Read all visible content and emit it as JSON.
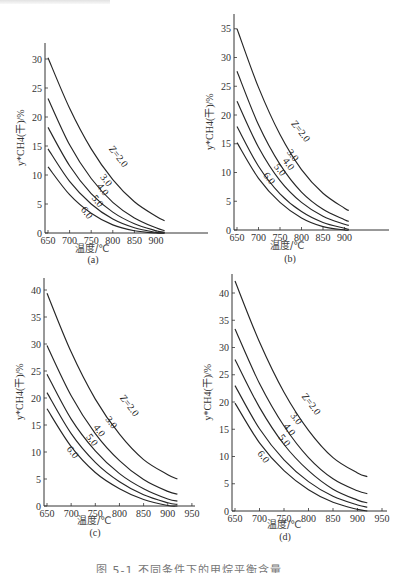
{
  "figure": {
    "caption": "图 5-1  不同条件下的甲烷平衡含量",
    "x_axis_label": "温度/℃",
    "y_axis_label": "y*CH4(干)/%"
  },
  "chart_data": [
    {
      "panel": "(a)",
      "type": "line",
      "xlabel": "温度/℃",
      "ylabel": "y*CH4(干)/%",
      "xlim": [
        650,
        920
      ],
      "ylim": [
        0,
        32
      ],
      "xticks": [
        650,
        700,
        750,
        800,
        850,
        900
      ],
      "yticks": [
        0,
        5,
        10,
        15,
        20,
        25,
        30
      ],
      "grid": false,
      "legend": "inline curve labels",
      "x": [
        650,
        700,
        750,
        800,
        850,
        900,
        920
      ],
      "series": [
        {
          "name": "Z=2.0",
          "values": [
            30.2,
            21.5,
            14.5,
            9.2,
            5.4,
            2.9,
            2.1
          ],
          "label_at": [
            790,
            14.5
          ],
          "label": "Z=2.0"
        },
        {
          "name": "3.0",
          "values": [
            23.2,
            15.2,
            9.4,
            5.3,
            2.6,
            0.9,
            0.4
          ],
          "label_at": [
            770,
            9.6
          ],
          "label": "3.0"
        },
        {
          "name": "4.0",
          "values": [
            18.2,
            11.6,
            6.8,
            3.6,
            1.6,
            0.4,
            0.1
          ],
          "label_at": [
            762,
            8.0
          ],
          "label": "4.0"
        },
        {
          "name": "5.0",
          "values": [
            14.5,
            8.9,
            5.0,
            2.4,
            0.9,
            0.1,
            0.0
          ],
          "label_at": [
            750,
            6.0
          ],
          "label": "5.0"
        },
        {
          "name": "6.0",
          "values": [
            11.4,
            6.6,
            3.4,
            1.4,
            0.4,
            0.0,
            0.0
          ],
          "label_at": [
            725,
            4.0
          ],
          "label": "6.0"
        }
      ]
    },
    {
      "panel": "(b)",
      "type": "line",
      "xlabel": "温度/℃",
      "ylabel": "y*CH4(干)/%",
      "xlim": [
        650,
        915
      ],
      "ylim": [
        0,
        37
      ],
      "xticks": [
        650,
        700,
        750,
        800,
        850,
        900
      ],
      "yticks": [
        0,
        5,
        10,
        15,
        20,
        25,
        30,
        35
      ],
      "grid": false,
      "legend": "inline curve labels",
      "x": [
        650,
        700,
        750,
        800,
        850,
        900,
        910
      ],
      "series": [
        {
          "name": "Z=2.0",
          "values": [
            35.0,
            24.8,
            16.6,
            10.5,
            6.4,
            3.8,
            3.4
          ],
          "label_at": [
            775,
            18.5
          ],
          "label": "Z=2.0"
        },
        {
          "name": "3.0",
          "values": [
            27.6,
            18.3,
            11.4,
            6.6,
            3.6,
            1.8,
            1.5
          ],
          "label_at": [
            765,
            13.5
          ],
          "label": "3.0"
        },
        {
          "name": "4.0",
          "values": [
            22.4,
            14.4,
            8.6,
            4.8,
            2.4,
            1.0,
            0.8
          ],
          "label_at": [
            755,
            12.0
          ],
          "label": "4.0"
        },
        {
          "name": "5.0",
          "values": [
            18.0,
            11.1,
            6.3,
            3.2,
            1.3,
            0.3,
            0.1
          ],
          "label_at": [
            735,
            11.0
          ],
          "label": "5.0"
        },
        {
          "name": "6.0",
          "values": [
            15.2,
            9.0,
            4.8,
            2.1,
            0.6,
            0.0,
            0.0
          ],
          "label_at": [
            710,
            9.5
          ],
          "label": "6.0"
        }
      ]
    },
    {
      "panel": "(c)",
      "type": "line",
      "xlabel": "温度/℃",
      "ylabel": "y*CH4(干)/%",
      "xlim": [
        650,
        950
      ],
      "ylim": [
        0,
        42
      ],
      "xticks": [
        650,
        700,
        750,
        800,
        850,
        900,
        950
      ],
      "yticks": [
        0,
        5,
        10,
        15,
        20,
        25,
        30,
        35,
        40
      ],
      "grid": false,
      "legend": "inline curve labels",
      "x": [
        650,
        700,
        750,
        800,
        850,
        900,
        920
      ],
      "series": [
        {
          "name": "Z=2.0",
          "values": [
            39.4,
            28.5,
            19.8,
            13.3,
            8.6,
            5.8,
            5.0
          ],
          "label_at": [
            800,
            20.0
          ],
          "label": "Z=2.0"
        },
        {
          "name": "3.0",
          "values": [
            29.7,
            20.4,
            13.4,
            8.4,
            4.9,
            2.7,
            2.2
          ],
          "label_at": [
            770,
            16.0
          ],
          "label": "3.0"
        },
        {
          "name": "4.0",
          "values": [
            24.4,
            16.1,
            10.2,
            6.0,
            3.2,
            1.3,
            0.9
          ],
          "label_at": [
            745,
            14.5
          ],
          "label": "4.0"
        },
        {
          "name": "5.0",
          "values": [
            21.0,
            13.4,
            8.1,
            4.5,
            2.1,
            0.6,
            0.3
          ],
          "label_at": [
            730,
            12.8
          ],
          "label": "5.0"
        },
        {
          "name": "6.0",
          "values": [
            18.0,
            11.0,
            6.2,
            3.2,
            1.2,
            0.1,
            0.0
          ],
          "label_at": [
            690,
            10.5
          ],
          "label": "6.0"
        }
      ]
    },
    {
      "panel": "(d)",
      "type": "line",
      "xlabel": "温度/℃",
      "ylabel": "y*CH4(干)/%",
      "xlim": [
        650,
        950
      ],
      "ylim": [
        0,
        43
      ],
      "xticks": [
        650,
        700,
        750,
        800,
        850,
        900,
        950
      ],
      "yticks": [
        0,
        5,
        10,
        15,
        20,
        25,
        30,
        35,
        40
      ],
      "grid": false,
      "legend": "inline curve labels",
      "x": [
        650,
        700,
        750,
        800,
        850,
        900,
        920
      ],
      "series": [
        {
          "name": "Z=2.0",
          "values": [
            42.2,
            31.0,
            21.8,
            14.8,
            9.8,
            7.0,
            6.3
          ],
          "label_at": [
            785,
            21.0
          ],
          "label": "Z=2.0"
        },
        {
          "name": "3.0",
          "values": [
            33.4,
            23.4,
            15.6,
            9.8,
            5.9,
            3.7,
            3.2
          ],
          "label_at": [
            762,
            17.5
          ],
          "label": "3.0"
        },
        {
          "name": "4.0",
          "values": [
            27.8,
            19.0,
            12.2,
            7.4,
            4.0,
            2.0,
            1.5
          ],
          "label_at": [
            748,
            15.5
          ],
          "label": "4.0"
        },
        {
          "name": "5.0",
          "values": [
            23.0,
            15.1,
            9.4,
            5.4,
            2.7,
            1.1,
            0.7
          ],
          "label_at": [
            738,
            13.5
          ],
          "label": "5.0"
        },
        {
          "name": "6.0",
          "values": [
            19.8,
            12.5,
            7.4,
            3.9,
            1.6,
            0.3,
            0.0
          ],
          "label_at": [
            695,
            10.5
          ],
          "label": "6.0"
        }
      ]
    }
  ],
  "layout": {
    "panels": [
      {
        "origin": [
          45,
          233
        ],
        "x_px_per_unit": 0.432,
        "y_px_per_unit": 5.8,
        "axis_top": 43,
        "axis_right": 208,
        "sub_pos": [
          93,
          263
        ],
        "xlabel_pos": [
          75,
          252
        ]
      },
      {
        "origin": [
          234,
          230
        ],
        "x_px_per_unit": 0.43,
        "y_px_per_unit": 5.75,
        "axis_top": 14,
        "axis_right": 389,
        "sub_pos": [
          290,
          262
        ],
        "xlabel_pos": [
          270,
          249
        ]
      },
      {
        "origin": [
          44,
          506
        ],
        "x_px_per_unit": 0.483,
        "y_px_per_unit": 5.4,
        "axis_top": 278,
        "axis_right": 195,
        "sub_pos": [
          95,
          536
        ],
        "xlabel_pos": [
          77,
          524
        ]
      },
      {
        "origin": [
          232,
          511
        ],
        "x_px_per_unit": 0.49,
        "y_px_per_unit": 5.45,
        "axis_top": 274,
        "axis_right": 387,
        "sub_pos": [
          285,
          540
        ],
        "xlabel_pos": [
          267,
          528
        ]
      }
    ]
  }
}
